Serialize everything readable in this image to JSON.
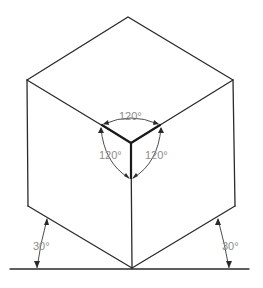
{
  "diagram": {
    "colors": {
      "line": "#2b2b2b",
      "label": "#8c8c8c",
      "background": "#ffffff"
    },
    "angle_labels": {
      "top": "120°",
      "left": "120°",
      "right": "120°",
      "base_left": "30°",
      "base_right": "30°"
    },
    "vertices": {
      "top": [
        128,
        17
      ],
      "left_top": [
        27,
        80
      ],
      "right_top": [
        233,
        80
      ],
      "center": [
        131,
        143
      ],
      "left_bottom": [
        28,
        206
      ],
      "right_bottom": [
        235,
        206
      ],
      "bottom": [
        132,
        268
      ]
    },
    "baseline": {
      "x1": 10,
      "x2": 249,
      "y": 269
    }
  }
}
